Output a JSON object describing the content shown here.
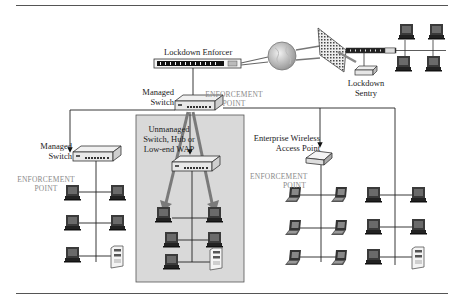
{
  "figure": {
    "nodes": {
      "lockdown_enforcer": "Lockdown Enforcer",
      "lockdown_sentry_line1": "Lockdown",
      "lockdown_sentry_line2": "Sentry",
      "managed_switch_top_line1": "Managed",
      "managed_switch_top_line2": "Switch",
      "managed_switch_left_line1": "Managed",
      "managed_switch_left_line2": "Switch",
      "unmanaged_line1": "Unmanaged",
      "unmanaged_line2": "Switch, Hub or",
      "unmanaged_line3": "Low-end WAP",
      "wireless_line1": "Enterprise Wireless",
      "wireless_line2": "Access Point"
    },
    "enforcement_point": {
      "line1": "ENFORCEMENT",
      "line2": "POINT"
    },
    "colors": {
      "rule": "#555555",
      "shaded_zone": "#d9d9d9",
      "zone_border": "#555555",
      "enforcement_text": "#8a8a8a",
      "arrow_gray": "#7a7a7a"
    }
  }
}
